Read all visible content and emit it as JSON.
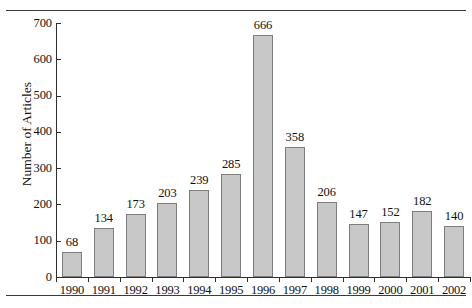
{
  "figure": {
    "background_color": "#ffffff",
    "rule_color": "#3b3b3b",
    "axis_color": "#2e2e2e"
  },
  "chart_data": {
    "type": "bar",
    "title": "",
    "subtitle": "",
    "xlabel": "",
    "ylabel": "Number of Articles",
    "categories": [
      "1990",
      "1991",
      "1992",
      "1993",
      "1994",
      "1995",
      "1996",
      "1997",
      "1998",
      "1999",
      "2000",
      "2001",
      "2002"
    ],
    "values": [
      68,
      134,
      173,
      203,
      239,
      285,
      666,
      358,
      206,
      147,
      152,
      182,
      140
    ],
    "value_labels": [
      "68",
      "134",
      "173",
      "203",
      "239",
      "285",
      "666",
      "358",
      "206",
      "147",
      "152",
      "182",
      "140"
    ],
    "ylim": [
      0,
      700
    ],
    "ytick_values": [
      0,
      100,
      200,
      300,
      400,
      500,
      600,
      700
    ],
    "ytick_labels": [
      "0",
      "100",
      "200",
      "300",
      "400",
      "500",
      "600",
      "700"
    ],
    "grid": false,
    "legend": null,
    "legend_position": "none",
    "bar_fill_color": "#c8c8c8",
    "bar_border_color": "#7d7d7d",
    "data_labels_shown": true,
    "annotations": []
  }
}
